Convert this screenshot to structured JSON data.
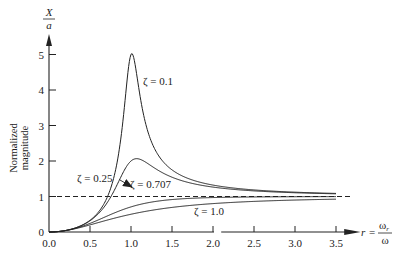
{
  "chart_data": {
    "type": "line",
    "title": "",
    "xlabel": "r = ω_r / ω",
    "xlabel_parts": {
      "lhs": "r",
      "eq": "=",
      "num": "ω",
      "num_sub": "r",
      "den": "ω"
    },
    "ylabel": "Normalized magnitude",
    "ylabel_lines": [
      "Normalized",
      "magnitude"
    ],
    "y_axis_symbol": {
      "num": "X",
      "den": "a"
    },
    "xlim": [
      0.0,
      3.5
    ],
    "ylim": [
      0,
      5
    ],
    "x_ticks": [
      "0.0",
      "0.5",
      "1.0",
      "1.5",
      "2.0",
      "2.5",
      "3.0",
      "3.5"
    ],
    "x_tick_values": [
      0.0,
      0.5,
      1.0,
      1.5,
      2.0,
      2.5,
      3.0,
      3.5
    ],
    "y_ticks": [
      "0",
      "1",
      "2",
      "3",
      "4",
      "5"
    ],
    "y_tick_values": [
      0,
      1,
      2,
      3,
      4,
      5
    ],
    "grid": false,
    "reference_line": {
      "y": 1,
      "style": "dashed"
    },
    "series": [
      {
        "name": "ζ = 0.1",
        "zeta": 0.1,
        "label": "ζ = 0.1"
      },
      {
        "name": "ζ = 0.25",
        "zeta": 0.25,
        "label": "ζ = 0.25"
      },
      {
        "name": "ζ = 0.707",
        "zeta": 0.707,
        "label": "ζ = 0.707"
      },
      {
        "name": "ζ = 1.0",
        "zeta": 1.0,
        "label": "ζ = 1.0"
      }
    ],
    "formula": "X/a = r^2 / sqrt((1 - r^2)^2 + (2 ζ r)^2)",
    "annotations": [
      {
        "text": "ζ = 0.1",
        "at_r": 1.15,
        "at_y": 4.3
      },
      {
        "text": "ζ = 0.25",
        "arrow_to_r": 1.02,
        "arrow_to_y": 1.95
      },
      {
        "text": "ζ = 0.707",
        "at_r": 1.2,
        "at_y": 1.3
      },
      {
        "text": "ζ = 1.0",
        "at_r": 1.75,
        "at_y": 0.55
      }
    ]
  }
}
